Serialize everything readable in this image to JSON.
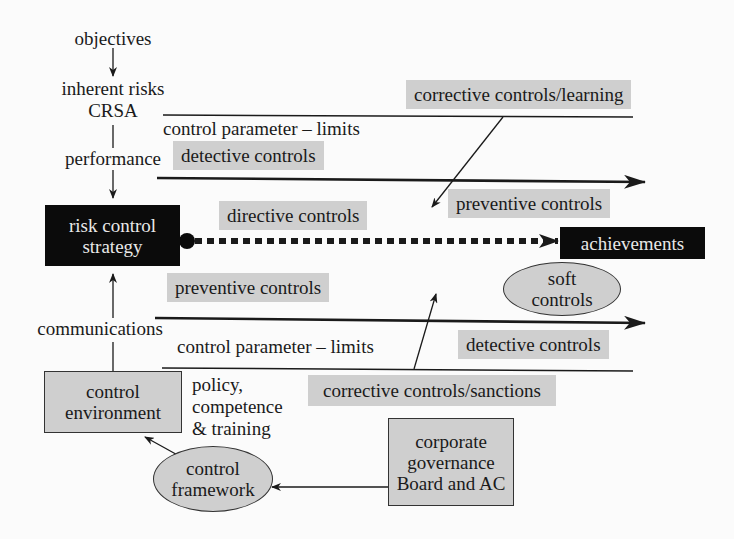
{
  "flow_left": {
    "objectives": "objectives",
    "inherent_risks": "inherent risks",
    "crsa": "CRSA",
    "performance": "performance",
    "communications": "communications"
  },
  "nodes": {
    "risk_control_strategy_line1": "risk control",
    "risk_control_strategy_line2": "strategy",
    "achievements": "achievements",
    "soft_controls_line1": "soft",
    "soft_controls_line2": "controls",
    "control_environment_line1": "control",
    "control_environment_line2": "environment",
    "control_framework_line1": "control",
    "control_framework_line2": "framework",
    "corporate_governance_line1": "corporate",
    "corporate_governance_line2": "governance",
    "corporate_governance_line3": "Board and AC"
  },
  "upper_band": {
    "corrective": "corrective controls/learning",
    "limits": "control parameter – limits",
    "detective": "detective controls",
    "preventive": "preventive controls"
  },
  "middle": {
    "directive": "directive controls"
  },
  "lower_band": {
    "preventive": "preventive controls",
    "limits": "control parameter – limits",
    "detective": "detective controls",
    "corrective": "corrective controls/sanctions"
  },
  "policy": {
    "line1": "policy,",
    "line2": "competence",
    "line3": "& training"
  },
  "colors": {
    "gray_fill": "#cfcfcf",
    "black_fill": "#0b0b0b",
    "line": "#1a1a1a"
  }
}
